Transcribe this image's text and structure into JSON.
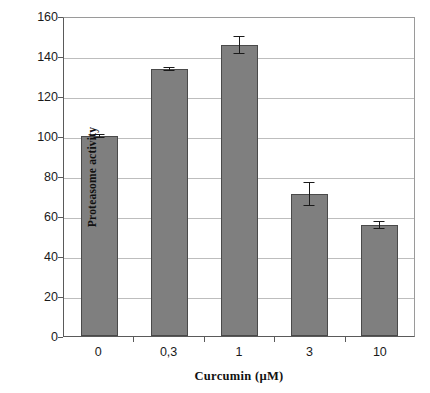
{
  "chart_data": {
    "type": "bar",
    "title": "",
    "subtitle": "",
    "categories": [
      "0",
      "0,3",
      "1",
      "3",
      "10"
    ],
    "values": [
      100,
      133.5,
      145.5,
      71,
      55.5
    ],
    "errors": [
      0.8,
      0.8,
      4.5,
      6,
      1.8
    ],
    "xlabel": "Curcumin (µM)",
    "ylabel": "Proteasome activity",
    "ylim": [
      0,
      160
    ],
    "yticks": [
      0,
      20,
      40,
      60,
      80,
      100,
      120,
      140,
      160
    ],
    "ytick_labels": [
      "0",
      "20",
      "40",
      "60",
      "80",
      "100",
      "120",
      "140",
      "160"
    ],
    "grid": "horizontal",
    "legend": "none",
    "bar_color": "#7f7f7f",
    "bar_edge_color": "#4a4a4a",
    "error_bar_color": "#1a1a1a",
    "gridline_color": "#bdbdbd",
    "axis_color": "#5a5a5a",
    "background_color": "#ffffff",
    "annotations": []
  }
}
